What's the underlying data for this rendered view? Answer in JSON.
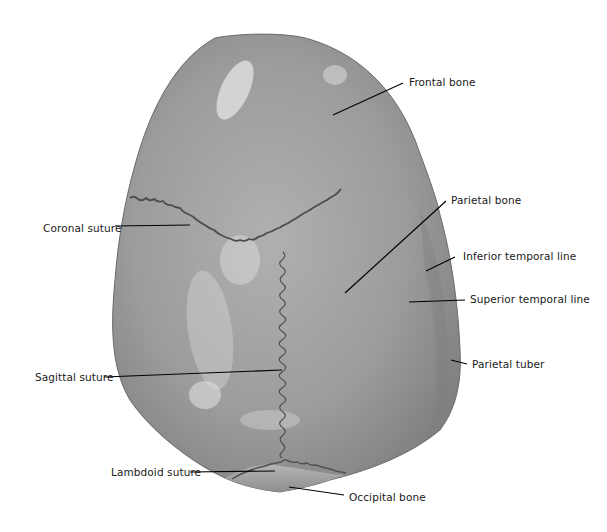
{
  "figure": {
    "colors": {
      "bone_base": "#9a9a9a",
      "bone_highlight": "#d4d4d4",
      "bone_shadow": "#7a7a7a",
      "suture": "#4a4a4a",
      "leader_line": "#000000",
      "background": "#ffffff"
    },
    "labels": [
      {
        "id": "frontal-bone",
        "text": "Frontal bone"
      },
      {
        "id": "parietal-bone",
        "text": "Parietal bone"
      },
      {
        "id": "inferior-temporal-line",
        "text": "Inferior temporal line"
      },
      {
        "id": "superior-temporal-line",
        "text": "Superior temporal line"
      },
      {
        "id": "parietal-tuber",
        "text": "Parietal tuber"
      },
      {
        "id": "coronal-suture",
        "text": "Coronal suture"
      },
      {
        "id": "sagittal-suture",
        "text": "Sagittal suture"
      },
      {
        "id": "lambdoid-suture",
        "text": "Lambdoid suture"
      },
      {
        "id": "occipital-bone",
        "text": "Occipital bone"
      }
    ]
  }
}
